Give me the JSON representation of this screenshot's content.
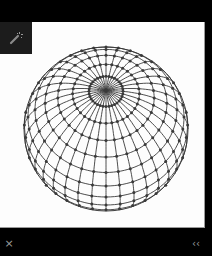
{
  "window": {
    "background": "#000000"
  },
  "toolbar": {
    "tool_icon": "magic-wand-icon",
    "tool_label": ""
  },
  "viewer": {
    "image_subject": "wireframe-sphere-globe",
    "background": "#fdfdfd",
    "line_color": "#3a3a3a",
    "sphere": {
      "center_x": 106,
      "center_y": 107,
      "radius": 82,
      "tilt_degrees": 62,
      "latitude_lines": 14,
      "longitude_lines": 36
    }
  },
  "bottom_bar": {
    "close_icon": "close-icon",
    "close_label": "×",
    "caption": "",
    "caption_sub": "",
    "collapse_icon": "chevron-double-left-icon",
    "collapse_label": "‹‹"
  }
}
